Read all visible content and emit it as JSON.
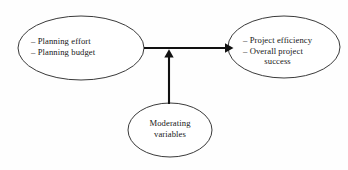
{
  "diagram": {
    "background_color": "#fefefe",
    "stroke_color": "#3a3a3a",
    "arrow_color": "#111111",
    "text_color": "#171717",
    "nodes": {
      "planning": {
        "name": "Planning predictor",
        "lines": [
          "– Planning effort",
          "– Planning budget"
        ],
        "line1": "– Planning effort",
        "line2": "– Planning budget"
      },
      "outcome": {
        "name": "Project outcome",
        "lines": [
          "– Project efficiency",
          "– Overall project",
          "success"
        ],
        "line1": "– Project efficiency",
        "line2": "– Overall project",
        "line3": "success"
      },
      "moderating": {
        "name": "Moderating variables",
        "lines": [
          "Moderating",
          "variables"
        ],
        "line1": "Moderating",
        "line2": "variables"
      }
    },
    "connectors": [
      {
        "id": "planning-to-outcome",
        "type": "arrow",
        "direction": "horizontal",
        "from": "planning",
        "to": "outcome"
      },
      {
        "id": "moderating-to-path",
        "type": "arrow",
        "direction": "vertical",
        "from": "moderating",
        "to": "planning-to-outcome"
      }
    ]
  }
}
